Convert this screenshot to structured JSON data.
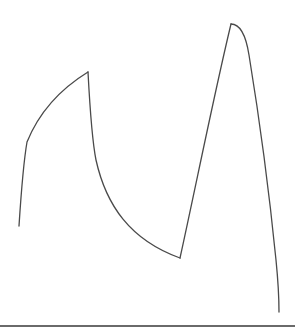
{
  "drawing": {
    "description": "Hand-drawn line sketch with two peaks resembling an M shape above a horizontal baseline",
    "stroke_color": "#4a4a4a",
    "baseline_color": "#6a6a6a",
    "background": "#ffffff",
    "points": [
      {
        "label": "start",
        "x": 19,
        "y": 226
      },
      {
        "label": "peak-1",
        "x": 88,
        "y": 72
      },
      {
        "label": "valley",
        "x": 180,
        "y": 258
      },
      {
        "label": "peak-2",
        "x": 231,
        "y": 24
      },
      {
        "label": "end",
        "x": 279,
        "y": 312
      }
    ]
  }
}
